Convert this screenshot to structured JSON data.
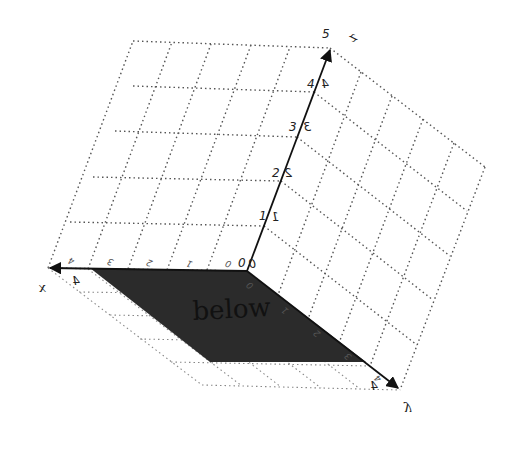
{
  "diagram": {
    "type": "3d-axes-with-plane",
    "origin_label": "0",
    "axes": {
      "z": {
        "name": "z",
        "ticks": [
          "0",
          "1",
          "2",
          "3",
          "4"
        ],
        "end_label": "5",
        "mirror_labels": [
          "0",
          "1",
          "2",
          "3",
          "4"
        ]
      },
      "x": {
        "name": "x",
        "ticks": [
          "0",
          "1",
          "2",
          "3",
          "4"
        ],
        "end_label": "4"
      },
      "y": {
        "name": "y",
        "ticks": [
          "0",
          "1",
          "2",
          "3",
          "4"
        ],
        "end_label": "4"
      }
    },
    "plane": {
      "label": "below",
      "color": "#2b2b2b"
    },
    "grid": {
      "divisions": 5,
      "style": "dotted"
    }
  }
}
